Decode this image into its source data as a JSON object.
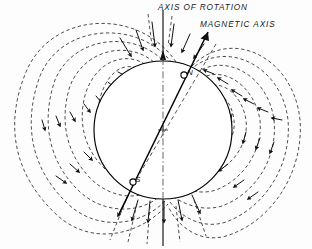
{
  "figure": {
    "title_hidden": "",
    "labels": {
      "axis_of_rotation": "AXIS OF ROTATION",
      "magnetic_axis": "MAGNETIC AXIS",
      "north_pole": "N",
      "south_pole": "S"
    },
    "colors": {
      "background": "#fdfdfd",
      "field_line": "#3a3a3a",
      "body_outline": "#000000",
      "axis": "#555555",
      "magnetic_axis": "#000000",
      "text": "#1a1a1a"
    },
    "geometry": {
      "width": 312,
      "height": 249,
      "body_center_x": 163,
      "body_center_y": 130,
      "body_radius": 69,
      "magnetic_tilt_degrees": 22,
      "north_pole_x": 185,
      "north_pole_y": 73,
      "south_pole_x": 133,
      "south_pole_y": 186
    },
    "elements": {
      "body_name": "planet-sphere",
      "field_name": "dipole-magnetic-field-lines",
      "rotation_axis_name": "rotation-axis",
      "magnetic_axis_name": "magnetic-axis"
    }
  }
}
